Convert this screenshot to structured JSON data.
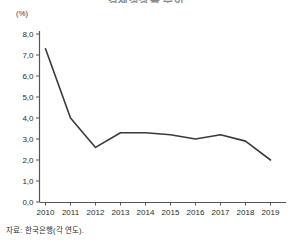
{
  "chart_data": {
    "type": "line",
    "title": "경제성장률 추이",
    "title_clipped": true,
    "unit_label": "(%)",
    "categories": [
      "2010",
      "2011",
      "2012",
      "2013",
      "2014",
      "2015",
      "2016",
      "2017",
      "2018",
      "2019"
    ],
    "x": [
      2010,
      2011,
      2012,
      2013,
      2014,
      2015,
      2016,
      2017,
      2018,
      2019
    ],
    "values": [
      7.3,
      4.0,
      2.6,
      3.3,
      3.3,
      3.2,
      3.0,
      3.2,
      2.9,
      2.0
    ],
    "series": [
      {
        "name": "경제성장률",
        "values": [
          7.3,
          4.0,
          2.6,
          3.3,
          3.3,
          3.2,
          3.0,
          3.2,
          2.9,
          2.0
        ]
      }
    ],
    "xlabel": "",
    "ylabel": "",
    "ylim": [
      0.0,
      8.0
    ],
    "ytick_labels": [
      "0,0",
      "1,0",
      "2,0",
      "3,0",
      "4,0",
      "5,0",
      "6,0",
      "7,0",
      "8,0"
    ],
    "ytick_values": [
      0.0,
      1.0,
      2.0,
      3.0,
      4.0,
      5.0,
      6.0,
      7.0,
      8.0
    ],
    "grid": false,
    "legend": false,
    "legend_position": "none",
    "line_color": "#3a3a3a",
    "axis_color": "#555555",
    "markers": false
  },
  "source": {
    "note": "자료: 한국은행(각 연도)."
  },
  "colors": {
    "background": "#ffffff",
    "line": "#3a3a3a",
    "axis": "#555555",
    "text": "#2b2b2b"
  }
}
